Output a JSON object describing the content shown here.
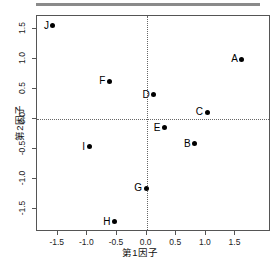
{
  "chart_data": {
    "type": "scatter",
    "title": "",
    "xlabel": "第1因子",
    "ylabel": "第2因子",
    "xlim": [
      -1.85,
      2.1
    ],
    "ylim": [
      -1.88,
      1.72
    ],
    "xticks": [
      "-1.5",
      "-1.0",
      "-0.5",
      "0.0",
      "0.5",
      "1.0",
      "1.5"
    ],
    "xtick_values": [
      -1.5,
      -1.0,
      -0.5,
      0.0,
      0.5,
      1.0,
      1.5
    ],
    "yticks": [
      "1.5",
      "1.0",
      "0.5",
      "0.0",
      "-0.5",
      "-1.0",
      "-1.5"
    ],
    "ytick_values": [
      1.5,
      1.0,
      0.5,
      0.0,
      -0.5,
      -1.0,
      -1.5
    ],
    "grid": false,
    "reference_lines": {
      "h": 0.0,
      "v": 0.0,
      "style": "dotted"
    },
    "legend": null,
    "point_color": "#000000",
    "points": [
      {
        "label": "A",
        "x": 1.61,
        "y": 1.0
      },
      {
        "label": "B",
        "x": 0.81,
        "y": -0.41
      },
      {
        "label": "C",
        "x": 1.02,
        "y": 0.12
      },
      {
        "label": "D",
        "x": 0.12,
        "y": 0.41
      },
      {
        "label": "E",
        "x": 0.3,
        "y": -0.14
      },
      {
        "label": "F",
        "x": -0.63,
        "y": 0.63
      },
      {
        "label": "G",
        "x": -0.01,
        "y": -1.15
      },
      {
        "label": "H",
        "x": -0.54,
        "y": -1.71
      },
      {
        "label": "I",
        "x": -0.97,
        "y": -0.46
      },
      {
        "label": "J",
        "x": -1.58,
        "y": 1.56
      }
    ]
  }
}
